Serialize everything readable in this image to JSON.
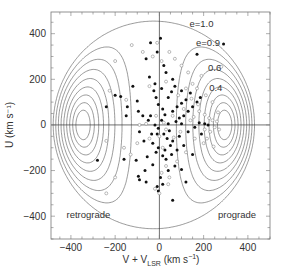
{
  "chart_data": {
    "type": "scatter",
    "title": "",
    "xlabel": "V + V_LSR (km s⁻¹)",
    "xlabel_main": "V + V",
    "xlabel_sub": "LSR",
    "xlabel_unit": " (km s",
    "xlabel_sup": "−1",
    "xlabel_close": ")",
    "ylabel": "U (km s⁻¹)",
    "xlim": [
      -490,
      500
    ],
    "ylim": [
      -500,
      495
    ],
    "xticks": [
      -400,
      -200,
      0,
      200,
      400
    ],
    "yticks": [
      -400,
      -200,
      0,
      200,
      400
    ],
    "xtick_labels": [
      "−400",
      "−200",
      "0",
      "200",
      "400"
    ],
    "ytick_labels": [
      "−400",
      "−200",
      "0",
      "200",
      "400"
    ],
    "minor_tick_step": 50,
    "grid": false,
    "zero_lines": true,
    "annotations": [
      {
        "text": "retrograde",
        "x": -420,
        "y": -410
      },
      {
        "text": "prograde",
        "x": 265,
        "y": -410
      }
    ],
    "contours": {
      "quantity": "orbital eccentricity e",
      "levels": [
        0.2,
        0.3,
        0.4,
        0.5,
        0.6,
        0.7,
        0.8,
        0.9,
        1.0
      ],
      "labels": [
        {
          "text": "e=1.0",
          "level": 1.0,
          "x": 190,
          "y": 430
        },
        {
          "text": "e=0.9",
          "level": 0.9,
          "x": 220,
          "y": 345
        },
        {
          "text": "0.6",
          "level": 0.6,
          "x": 250,
          "y": 235
        },
        {
          "text": "0.4",
          "level": 0.4,
          "x": 255,
          "y": 150
        }
      ]
    },
    "series": [
      {
        "name": "filled",
        "marker": "filled-circle",
        "points": [
          [
            -200,
            130
          ],
          [
            -145,
            80
          ],
          [
            -175,
            125
          ],
          [
            -120,
            170
          ],
          [
            -100,
            105
          ],
          [
            -95,
            60
          ],
          [
            -240,
            80
          ],
          [
            -60,
            290
          ],
          [
            -45,
            210
          ],
          [
            -150,
            40
          ],
          [
            -75,
            40
          ],
          [
            -90,
            -30
          ],
          [
            -20,
            0
          ],
          [
            -10,
            -40
          ],
          [
            -30,
            -80
          ],
          [
            -55,
            -140
          ],
          [
            -105,
            -155
          ],
          [
            -160,
            -150
          ],
          [
            -280,
            -155
          ],
          [
            -95,
            -225
          ],
          [
            -90,
            -240
          ],
          [
            -65,
            -200
          ],
          [
            -30,
            -175
          ],
          [
            5,
            -230
          ],
          [
            15,
            -260
          ],
          [
            30,
            -150
          ],
          [
            55,
            -130
          ],
          [
            80,
            -110
          ],
          [
            110,
            -90
          ],
          [
            60,
            -70
          ],
          [
            45,
            -25
          ],
          [
            40,
            5
          ],
          [
            75,
            15
          ],
          [
            90,
            30
          ],
          [
            110,
            40
          ],
          [
            130,
            60
          ],
          [
            150,
            80
          ],
          [
            170,
            100
          ],
          [
            185,
            120
          ],
          [
            120,
            110
          ],
          [
            140,
            140
          ],
          [
            100,
            150
          ],
          [
            70,
            170
          ],
          [
            60,
            200
          ],
          [
            30,
            230
          ],
          [
            20,
            260
          ],
          [
            -10,
            320
          ],
          [
            5,
            380
          ],
          [
            290,
            355
          ],
          [
            170,
            310
          ],
          [
            -40,
            360
          ],
          [
            -20,
            180
          ],
          [
            -25,
            150
          ],
          [
            -15,
            120
          ],
          [
            -5,
            90
          ],
          [
            15,
            70
          ],
          [
            25,
            45
          ],
          [
            10,
            20
          ],
          [
            -5,
            -15
          ],
          [
            20,
            -40
          ],
          [
            35,
            -60
          ],
          [
            50,
            -90
          ],
          [
            25,
            -110
          ],
          [
            15,
            -135
          ],
          [
            -5,
            -100
          ],
          [
            -15,
            -120
          ],
          [
            90,
            -50
          ],
          [
            130,
            -30
          ],
          [
            160,
            -10
          ],
          [
            180,
            10
          ],
          [
            205,
            5
          ],
          [
            220,
            0
          ],
          [
            190,
            -40
          ],
          [
            100,
            5
          ],
          [
            60,
            60
          ],
          [
            80,
            80
          ],
          [
            100,
            95
          ],
          [
            40,
            120
          ],
          [
            55,
            145
          ],
          [
            -40,
            40
          ],
          [
            -50,
            20
          ],
          [
            -35,
            -40
          ],
          [
            -70,
            -70
          ],
          [
            -60,
            -250
          ],
          [
            -10,
            -270
          ],
          [
            40,
            -200
          ],
          [
            70,
            -180
          ],
          [
            100,
            -195
          ],
          [
            120,
            -250
          ],
          [
            60,
            -330
          ],
          [
            -5,
            -290
          ],
          [
            150,
            -130
          ],
          [
            10,
            160
          ]
        ]
      },
      {
        "name": "open",
        "marker": "open-circle",
        "points": [
          [
            -200,
            280
          ],
          [
            -125,
            350
          ],
          [
            -225,
            150
          ],
          [
            -150,
            110
          ],
          [
            -240,
            -70
          ],
          [
            -160,
            -100
          ],
          [
            -130,
            -130
          ],
          [
            -200,
            -230
          ],
          [
            -240,
            -300
          ],
          [
            -75,
            320
          ],
          [
            -30,
            300
          ],
          [
            -10,
            360
          ],
          [
            -45,
            170
          ],
          [
            -90,
            0
          ],
          [
            -60,
            5
          ],
          [
            -45,
            -60
          ],
          [
            0,
            -50
          ],
          [
            15,
            -100
          ],
          [
            30,
            -180
          ],
          [
            10,
            -210
          ],
          [
            -20,
            -280
          ],
          [
            0,
            -300
          ],
          [
            45,
            -230
          ],
          [
            80,
            -160
          ],
          [
            120,
            -120
          ],
          [
            40,
            -260
          ],
          [
            65,
            -55
          ],
          [
            95,
            -30
          ],
          [
            140,
            20
          ],
          [
            155,
            35
          ],
          [
            180,
            60
          ],
          [
            205,
            45
          ],
          [
            225,
            30
          ],
          [
            240,
            20
          ],
          [
            250,
            -10
          ],
          [
            230,
            -30
          ],
          [
            215,
            -60
          ],
          [
            200,
            -80
          ],
          [
            245,
            -95
          ],
          [
            270,
            -20
          ],
          [
            265,
            55
          ],
          [
            240,
            100
          ],
          [
            210,
            130
          ],
          [
            170,
            160
          ],
          [
            150,
            180
          ],
          [
            190,
            215
          ],
          [
            130,
            230
          ],
          [
            100,
            260
          ],
          [
            280,
            255
          ],
          [
            70,
            290
          ],
          [
            45,
            320
          ],
          [
            10,
            280
          ],
          [
            30,
            190
          ],
          [
            85,
            130
          ],
          [
            120,
            160
          ],
          [
            145,
            115
          ],
          [
            175,
            90
          ],
          [
            110,
            70
          ],
          [
            60,
            40
          ],
          [
            20,
            10
          ],
          [
            -15,
            40
          ],
          [
            30,
            -20
          ],
          [
            160,
            -60
          ],
          [
            205,
            -20
          ],
          [
            260,
            15
          ],
          [
            -100,
            -80
          ]
        ]
      }
    ]
  }
}
